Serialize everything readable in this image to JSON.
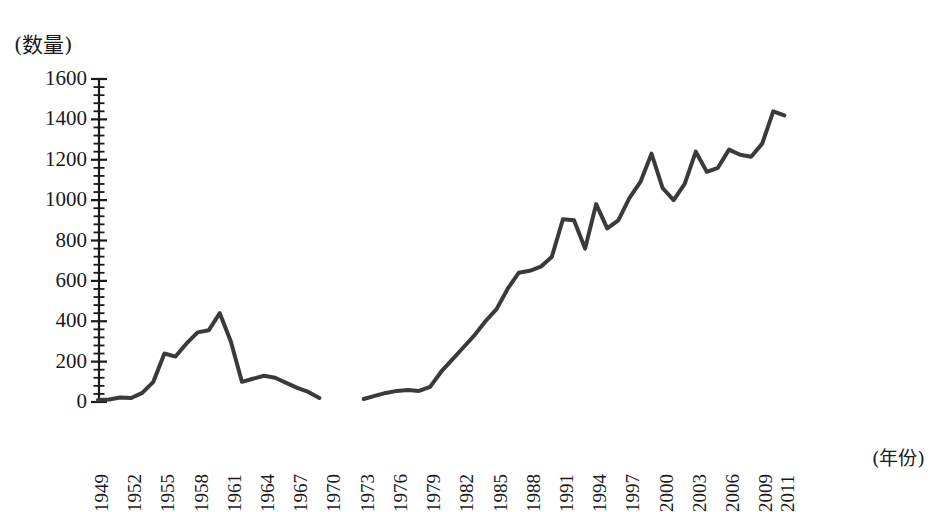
{
  "chart_data": {
    "type": "line",
    "title": "",
    "subtitle": "",
    "xlabel": "(年份)",
    "ylabel": "(数量)",
    "ylim": [
      0,
      1600
    ],
    "xlim": [
      1949,
      2012
    ],
    "y_ticks": [
      0,
      200,
      400,
      600,
      800,
      1000,
      1200,
      1400,
      1600
    ],
    "y_minor_ticks_per_interval": 5,
    "x_ticks": [
      1949,
      1952,
      1955,
      1958,
      1961,
      1964,
      1967,
      1970,
      1973,
      1976,
      1979,
      1982,
      1985,
      1988,
      1991,
      1994,
      1997,
      2000,
      2003,
      2006,
      2009,
      2011
    ],
    "grid": false,
    "legend": false,
    "legend_position": "none",
    "line_color": "#3a3a3a",
    "line_width": 4,
    "axis_color": "#1a1a1a",
    "background": "#ffffff",
    "note": "Series has a data gap between 1969 and 1973 (no observations plotted).",
    "series": [
      {
        "name": "数量",
        "x": [
          1949,
          1950,
          1951,
          1952,
          1953,
          1954,
          1955,
          1956,
          1957,
          1958,
          1959,
          1960,
          1961,
          1962,
          1963,
          1964,
          1965,
          1966,
          1967,
          1968,
          1969
        ],
        "values": [
          10,
          12,
          22,
          20,
          45,
          100,
          240,
          225,
          290,
          345,
          355,
          440,
          300,
          100,
          115,
          130,
          120,
          95,
          70,
          50,
          20
        ]
      },
      {
        "name": "数量 (续)",
        "x": [
          1973,
          1974,
          1975,
          1976,
          1977,
          1978,
          1979,
          1980,
          1981,
          1982,
          1983,
          1984,
          1985,
          1986,
          1987,
          1988,
          1989,
          1990,
          1991,
          1992,
          1993,
          1994,
          1995,
          1996,
          1997,
          1998,
          1999,
          2000,
          2001,
          2002,
          2003,
          2004,
          2005,
          2006,
          2007,
          2008,
          2009,
          2010,
          2011
        ],
        "values": [
          15,
          30,
          45,
          55,
          60,
          55,
          75,
          150,
          210,
          270,
          330,
          400,
          460,
          560,
          640,
          650,
          670,
          720,
          905,
          900,
          760,
          980,
          860,
          900,
          1010,
          1090,
          1230,
          1060,
          1000,
          1080,
          1240,
          1140,
          1160,
          1250,
          1225,
          1215,
          1280,
          1440,
          1420
        ]
      }
    ]
  },
  "axes": {
    "y_title": "(数量)",
    "x_title": "(年份)"
  }
}
